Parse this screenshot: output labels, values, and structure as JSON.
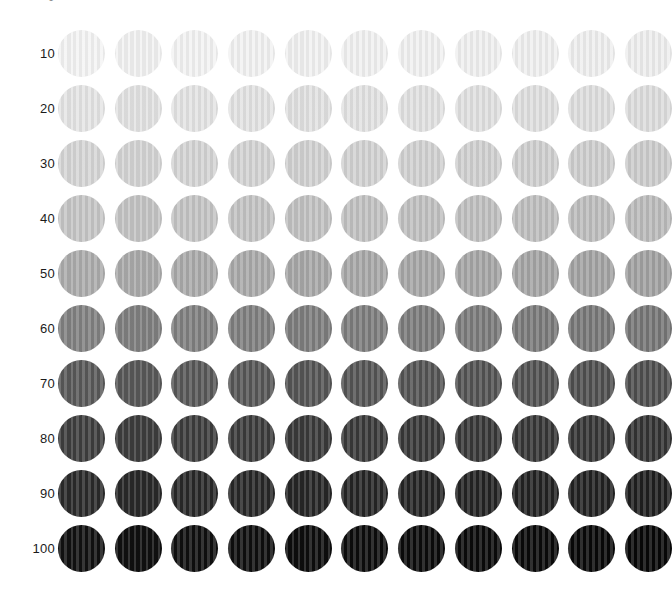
{
  "page": {
    "background_color": "#ffffff",
    "clipped_top_label": "0"
  },
  "chart_data": {
    "type": "heatmap",
    "title": "",
    "subtitle": "",
    "xlabel": "",
    "ylabel": "",
    "legend_position": "none",
    "grid": false,
    "marker_shape": "circle",
    "columns": 11,
    "rows": 10,
    "column_indices": [
      1,
      2,
      3,
      4,
      5,
      6,
      7,
      8,
      9,
      10,
      11
    ],
    "categories": [
      "10",
      "20",
      "30",
      "40",
      "50",
      "60",
      "70",
      "80",
      "90",
      "100"
    ],
    "row_tick_labels": [
      "10",
      "20",
      "30",
      "40",
      "50",
      "60",
      "70",
      "80",
      "90",
      "100"
    ],
    "values": [
      10,
      20,
      30,
      40,
      50,
      60,
      70,
      80,
      90,
      100
    ],
    "value_unit": "% black",
    "swatch_rows": [
      {
        "label": "10",
        "value": 10,
        "base_color": "#f2f2f2",
        "colors": [
          "#f4f4f4",
          "#f3f3f3",
          "#f3f3f3",
          "#f2f2f2",
          "#f2f2f2",
          "#f1f1f1",
          "#f1f1f1",
          "#f0f0f0",
          "#f0f0f0",
          "#efefef",
          "#eeeeee"
        ]
      },
      {
        "label": "20",
        "value": 20,
        "base_color": "#e2e2e2",
        "colors": [
          "#e5e5e5",
          "#e4e4e4",
          "#e4e4e4",
          "#e3e3e3",
          "#e2e2e2",
          "#e2e2e2",
          "#e1e1e1",
          "#e0e0e0",
          "#dfdfdf",
          "#dedede",
          "#dddddd"
        ]
      },
      {
        "label": "30",
        "value": 30,
        "base_color": "#d2d2d2",
        "colors": [
          "#d6d6d6",
          "#d5d5d5",
          "#d4d4d4",
          "#d3d3d3",
          "#d2d2d2",
          "#d2d2d2",
          "#d1d1d1",
          "#d0d0d0",
          "#cfcfcf",
          "#cecece",
          "#cccccc"
        ]
      },
      {
        "label": "40",
        "value": 40,
        "base_color": "#c2c2c2",
        "colors": [
          "#c6c6c6",
          "#c5c5c5",
          "#c4c4c4",
          "#c3c3c3",
          "#c2c2c2",
          "#c1c1c1",
          "#c0c0c0",
          "#bfbfbf",
          "#bebebe",
          "#bdbdbd",
          "#bbbbbb"
        ]
      },
      {
        "label": "50",
        "value": 50,
        "base_color": "#a8a8a8",
        "colors": [
          "#acacac",
          "#ababab",
          "#aaaaaa",
          "#a9a9a9",
          "#a8a8a8",
          "#a7a7a7",
          "#a6a6a6",
          "#a5a5a5",
          "#a4a4a4",
          "#a2a2a2",
          "#a1a1a1"
        ]
      },
      {
        "label": "60",
        "value": 60,
        "base_color": "#7d7d7d",
        "colors": [
          "#818181",
          "#808080",
          "#7f7f7f",
          "#7e7e7e",
          "#7d7d7d",
          "#7c7c7c",
          "#7b7b7b",
          "#7a7a7a",
          "#797979",
          "#777777",
          "#767676"
        ]
      },
      {
        "label": "70",
        "value": 70,
        "base_color": "#555555",
        "colors": [
          "#595959",
          "#585858",
          "#575757",
          "#565656",
          "#555555",
          "#545454",
          "#535353",
          "#525252",
          "#515151",
          "#4f4f4f",
          "#4e4e4e"
        ]
      },
      {
        "label": "80",
        "value": 80,
        "base_color": "#3a3a3a",
        "colors": [
          "#3e3e3e",
          "#3d3d3d",
          "#3c3c3c",
          "#3b3b3b",
          "#3a3a3a",
          "#393939",
          "#383838",
          "#373737",
          "#363636",
          "#353535",
          "#333333"
        ]
      },
      {
        "label": "90",
        "value": 90,
        "base_color": "#262626",
        "colors": [
          "#2a2a2a",
          "#292929",
          "#282828",
          "#272727",
          "#262626",
          "#252525",
          "#242424",
          "#232323",
          "#222222",
          "#212121",
          "#1f1f1f"
        ]
      },
      {
        "label": "100",
        "value": 100,
        "base_color": "#0d0d0d",
        "colors": [
          "#111111",
          "#101010",
          "#0f0f0f",
          "#0e0e0e",
          "#0d0d0d",
          "#0c0c0c",
          "#0b0b0b",
          "#0a0a0a",
          "#090909",
          "#080808",
          "#070707"
        ]
      }
    ]
  }
}
